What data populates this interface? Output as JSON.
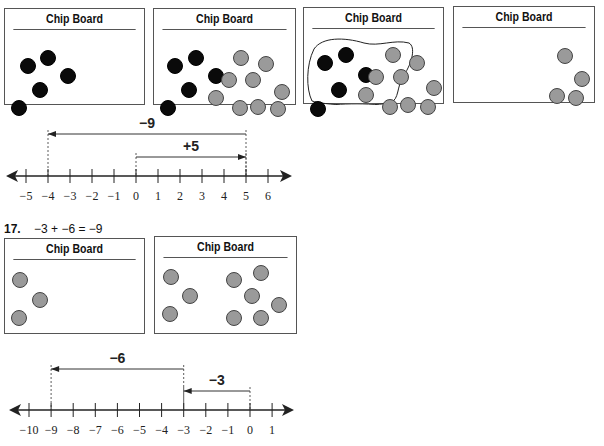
{
  "boards_top": [
    {
      "title": "Chip Board",
      "chips": [
        {
          "t": "neg",
          "x": 15,
          "y": 28
        },
        {
          "t": "neg",
          "x": 35,
          "y": 20
        },
        {
          "t": "neg",
          "x": 55,
          "y": 38
        },
        {
          "t": "neg",
          "x": 27,
          "y": 52
        },
        {
          "t": "neg",
          "x": 6,
          "y": 70
        }
      ]
    },
    {
      "title": "Chip Board",
      "chips": [
        {
          "t": "neg",
          "x": 13,
          "y": 28
        },
        {
          "t": "neg",
          "x": 34,
          "y": 20
        },
        {
          "t": "neg",
          "x": 54,
          "y": 38
        },
        {
          "t": "neg",
          "x": 27,
          "y": 52
        },
        {
          "t": "neg",
          "x": 6,
          "y": 70
        },
        {
          "t": "pos",
          "x": 79,
          "y": 20
        },
        {
          "t": "pos",
          "x": 104,
          "y": 26
        },
        {
          "t": "pos",
          "x": 67,
          "y": 42
        },
        {
          "t": "pos",
          "x": 91,
          "y": 42
        },
        {
          "t": "pos",
          "x": 54,
          "y": 60
        },
        {
          "t": "pos",
          "x": 120,
          "y": 54
        },
        {
          "t": "pos",
          "x": 78,
          "y": 70
        },
        {
          "t": "pos",
          "x": 96,
          "y": 69
        },
        {
          "t": "pos",
          "x": 116,
          "y": 71
        }
      ]
    },
    {
      "title": "Chip Board",
      "chips": [
        {
          "t": "neg",
          "x": 13,
          "y": 26
        },
        {
          "t": "neg",
          "x": 34,
          "y": 18
        },
        {
          "t": "neg",
          "x": 54,
          "y": 38
        },
        {
          "t": "neg",
          "x": 27,
          "y": 53
        },
        {
          "t": "neg",
          "x": 6,
          "y": 72
        },
        {
          "t": "pos",
          "x": 81,
          "y": 18
        },
        {
          "t": "pos",
          "x": 105,
          "y": 26
        },
        {
          "t": "pos",
          "x": 64,
          "y": 40
        },
        {
          "t": "pos",
          "x": 89,
          "y": 40
        },
        {
          "t": "pos",
          "x": 54,
          "y": 58
        },
        {
          "t": "pos",
          "x": 122,
          "y": 51
        },
        {
          "t": "pos",
          "x": 78,
          "y": 70
        },
        {
          "t": "pos",
          "x": 96,
          "y": 68
        },
        {
          "t": "pos",
          "x": 116,
          "y": 70
        }
      ]
    },
    {
      "title": "Chip Board",
      "chips": [
        {
          "t": "pos",
          "x": 103,
          "y": 20
        },
        {
          "t": "pos",
          "x": 120,
          "y": 43
        },
        {
          "t": "pos",
          "x": 95,
          "y": 60
        },
        {
          "t": "pos",
          "x": 114,
          "y": 62
        }
      ]
    }
  ],
  "numberline_1": {
    "min": -5,
    "max": 6,
    "tick_labels": [
      "−5",
      "−4",
      "−3",
      "−2",
      "−1",
      "0",
      "1",
      "2",
      "3",
      "4",
      "5",
      "6"
    ],
    "arrows": [
      {
        "label": "−9",
        "from": 5,
        "to": -4
      },
      {
        "label": "+5",
        "from": 0,
        "to": 5
      }
    ]
  },
  "problem_17": {
    "number": "17.",
    "equation": "−3 + −6 = −9"
  },
  "boards_bottom": [
    {
      "title": "Chip Board",
      "chips": [
        {
          "t": "pos",
          "x": 7,
          "y": 12
        },
        {
          "t": "pos",
          "x": 27,
          "y": 32
        },
        {
          "t": "pos",
          "x": 6,
          "y": 50
        }
      ]
    },
    {
      "title": "Chip Board",
      "chips": [
        {
          "t": "pos",
          "x": 8,
          "y": 11
        },
        {
          "t": "pos",
          "x": 27,
          "y": 30
        },
        {
          "t": "pos",
          "x": 7,
          "y": 48
        },
        {
          "t": "pos",
          "x": 71,
          "y": 14
        },
        {
          "t": "pos",
          "x": 98,
          "y": 7
        },
        {
          "t": "pos",
          "x": 89,
          "y": 30
        },
        {
          "t": "pos",
          "x": 116,
          "y": 39
        },
        {
          "t": "pos",
          "x": 71,
          "y": 52
        },
        {
          "t": "pos",
          "x": 98,
          "y": 52
        }
      ]
    }
  ],
  "numberline_2": {
    "min": -10,
    "max": 1,
    "tick_labels": [
      "−10",
      "−9",
      "−8",
      "−7",
      "−6",
      "−5",
      "−4",
      "−3",
      "−2",
      "−1",
      "0",
      "1"
    ],
    "arrows": [
      {
        "label": "−6",
        "from": -3,
        "to": -9
      },
      {
        "label": "−3",
        "from": 0,
        "to": -3
      }
    ]
  }
}
